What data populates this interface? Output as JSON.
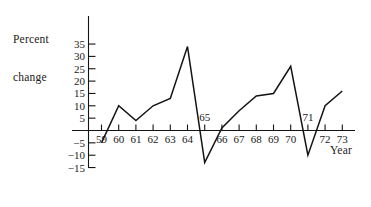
{
  "chart_data": {
    "type": "line",
    "title": "",
    "subtitle": "",
    "ylabel_line1": "Percent",
    "ylabel_line2": "change",
    "xlabel": "Year",
    "x": [
      1959,
      1960,
      1961,
      1962,
      1963,
      1964,
      1965,
      1966,
      1967,
      1968,
      1969,
      1970,
      1971,
      1972,
      1973
    ],
    "categories": [
      "59",
      "60",
      "61",
      "62",
      "63",
      "64",
      "65",
      "66",
      "67",
      "68",
      "69",
      "70",
      "71",
      "72",
      "73"
    ],
    "values": [
      -5,
      10,
      4,
      10,
      13,
      34,
      -13,
      1,
      8,
      14,
      15,
      26,
      -10,
      10,
      16
    ],
    "series": [
      {
        "name": "Percent change",
        "values": [
          -5,
          10,
          4,
          10,
          13,
          34,
          -13,
          1,
          8,
          14,
          15,
          26,
          -10,
          10,
          16
        ]
      }
    ],
    "ylim": [
      -15,
      35
    ],
    "xlim": [
      1959,
      1973
    ],
    "yticks": [
      -15,
      -10,
      -5,
      5,
      10,
      15,
      20,
      25,
      30,
      35
    ],
    "ytick_labels": [
      "−15",
      "−10",
      "−5",
      "5",
      "10",
      "15",
      "20",
      "25",
      "30",
      "35"
    ],
    "xticks": [
      1959,
      1960,
      1961,
      1962,
      1963,
      1964,
      1965,
      1966,
      1967,
      1968,
      1969,
      1970,
      1971,
      1972,
      1973
    ],
    "xtick_labels": [
      "59",
      "60",
      "61",
      "62",
      "63",
      "64",
      "65",
      "66",
      "67",
      "68",
      "69",
      "70",
      "71",
      "72",
      "73"
    ],
    "xtick_label_above_axis": [
      "65",
      "71"
    ],
    "grid": false,
    "legend": false,
    "legend_position": "none",
    "line_color": "#141414",
    "axis_color": "#141414",
    "background_color": "#ffffff"
  }
}
